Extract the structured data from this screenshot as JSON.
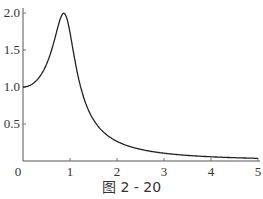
{
  "chart_data": {
    "type": "line",
    "title": "",
    "caption": "图 2 - 20",
    "xlabel": "",
    "ylabel": "",
    "xlim": [
      0,
      5
    ],
    "ylim": [
      0,
      2.0
    ],
    "x_ticks": [
      "0",
      "1",
      "2",
      "3",
      "4",
      "5"
    ],
    "y_ticks": [
      "0.5",
      "1.0",
      "1.5",
      "2.0"
    ],
    "grid": false,
    "series": [
      {
        "name": "amplitude ratio",
        "x": [
          0,
          0.2,
          0.4,
          0.6,
          0.8,
          0.87,
          1.0,
          1.2,
          1.4,
          1.6,
          2.0,
          2.5,
          3.0,
          4.0,
          5.0
        ],
        "y": [
          1.0,
          1.04,
          1.16,
          1.42,
          1.9,
          2.0,
          1.92,
          1.0,
          0.55,
          0.36,
          0.19,
          0.1,
          0.06,
          0.03,
          0.02
        ]
      }
    ],
    "color": "#222222"
  }
}
